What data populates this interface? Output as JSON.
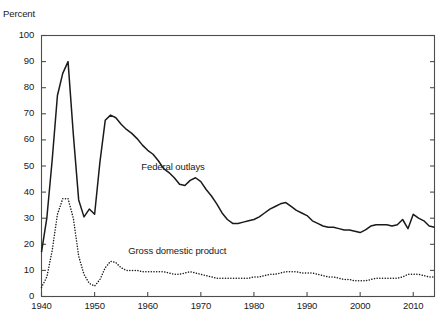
{
  "chart_data": {
    "type": "line",
    "title": "",
    "xlabel": "",
    "ylabel": "Percent",
    "ylim": [
      0,
      100
    ],
    "xlim": [
      1940,
      2014
    ],
    "yticks": [
      0,
      10,
      20,
      30,
      40,
      50,
      60,
      70,
      80,
      90,
      100
    ],
    "xticks": [
      1940,
      1950,
      1960,
      1970,
      1980,
      1990,
      2000,
      2010
    ],
    "grid": false,
    "legend_position": "inline-annotation",
    "annotations": [
      {
        "text": "Federal outlays",
        "x": 1965,
        "y": 49.5
      },
      {
        "text": "Gross domestic product",
        "x": 1965,
        "y": 17.5
      }
    ],
    "series": [
      {
        "name": "Federal outlays",
        "style": "solid",
        "color": "#1a1a1a",
        "x": [
          1940,
          1941,
          1942,
          1943,
          1944,
          1945,
          1946,
          1947,
          1948,
          1949,
          1950,
          1951,
          1952,
          1953,
          1954,
          1955,
          1956,
          1957,
          1958,
          1959,
          1960,
          1961,
          1962,
          1963,
          1964,
          1965,
          1966,
          1967,
          1968,
          1969,
          1970,
          1971,
          1972,
          1973,
          1974,
          1975,
          1976,
          1977,
          1978,
          1979,
          1980,
          1981,
          1982,
          1983,
          1984,
          1985,
          1986,
          1987,
          1988,
          1989,
          1990,
          1991,
          1992,
          1993,
          1994,
          1995,
          1996,
          1997,
          1998,
          1999,
          2000,
          2001,
          2002,
          2003,
          2004,
          2005,
          2006,
          2007,
          2008,
          2009,
          2010,
          2011,
          2012,
          2013,
          2014
        ],
        "values": [
          17.0,
          30.0,
          52.0,
          77.0,
          85.5,
          90.0,
          62.0,
          37.0,
          30.5,
          33.5,
          31.5,
          51.5,
          67.5,
          69.5,
          68.5,
          66.0,
          64.0,
          62.5,
          60.5,
          58.0,
          56.0,
          54.5,
          52.0,
          49.0,
          47.5,
          45.5,
          43.0,
          42.5,
          44.5,
          45.5,
          44.0,
          41.0,
          38.5,
          35.5,
          32.0,
          29.5,
          28.0,
          28.0,
          28.5,
          29.0,
          29.5,
          30.5,
          32.0,
          33.5,
          34.5,
          35.5,
          36.0,
          34.5,
          33.0,
          32.0,
          31.0,
          29.0,
          28.0,
          27.0,
          26.5,
          26.5,
          26.0,
          25.5,
          25.5,
          25.0,
          24.5,
          25.5,
          27.0,
          27.5,
          27.5,
          27.5,
          27.0,
          27.5,
          29.5,
          26.0,
          31.5,
          30.0,
          29.0,
          27.0,
          26.5
        ]
      },
      {
        "name": "Gross domestic product",
        "style": "dotted",
        "color": "#1a1a1a",
        "x": [
          1940,
          1941,
          1942,
          1943,
          1944,
          1945,
          1946,
          1947,
          1948,
          1949,
          1950,
          1951,
          1952,
          1953,
          1954,
          1955,
          1956,
          1957,
          1958,
          1959,
          1960,
          1961,
          1962,
          1963,
          1964,
          1965,
          1966,
          1967,
          1968,
          1969,
          1970,
          1971,
          1972,
          1973,
          1974,
          1975,
          1976,
          1977,
          1978,
          1979,
          1980,
          1981,
          1982,
          1983,
          1984,
          1985,
          1986,
          1987,
          1988,
          1989,
          1990,
          1991,
          1992,
          1993,
          1994,
          1995,
          1996,
          1997,
          1998,
          1999,
          2000,
          2001,
          2002,
          2003,
          2004,
          2005,
          2006,
          2007,
          2008,
          2009,
          2010,
          2011,
          2012,
          2013,
          2014
        ],
        "values": [
          3.5,
          7.5,
          17.5,
          31.5,
          37.5,
          37.5,
          30.0,
          15.5,
          8.5,
          5.0,
          4.0,
          6.5,
          11.0,
          13.5,
          13.0,
          11.0,
          10.0,
          10.0,
          10.0,
          9.5,
          9.5,
          9.5,
          9.5,
          9.5,
          9.0,
          8.5,
          8.5,
          9.0,
          9.5,
          9.0,
          8.5,
          8.0,
          7.5,
          7.0,
          7.0,
          7.0,
          7.0,
          7.0,
          7.0,
          7.0,
          7.5,
          7.5,
          8.0,
          8.5,
          8.5,
          9.0,
          9.5,
          9.5,
          9.5,
          9.0,
          9.0,
          9.0,
          8.5,
          8.0,
          7.5,
          7.5,
          7.0,
          6.5,
          6.5,
          6.0,
          6.0,
          6.0,
          6.5,
          7.0,
          7.0,
          7.0,
          7.0,
          7.0,
          7.5,
          8.5,
          8.5,
          8.5,
          8.0,
          7.5,
          7.5
        ]
      }
    ]
  },
  "axes": {
    "y_title": "Percent",
    "y_tick_labels": [
      "100",
      "90",
      "80",
      "70",
      "60",
      "50",
      "40",
      "30",
      "20",
      "10",
      "0"
    ],
    "x_tick_labels": [
      "1940",
      "1950",
      "1960",
      "1970",
      "1980",
      "1990",
      "2000",
      "2010"
    ]
  },
  "labels": {
    "federal_outlays": "Federal outlays",
    "gross_domestic_product": "Gross domestic product"
  },
  "colors": {
    "line": "#1a1a1a",
    "axis": "#4d4d4d",
    "background": "#ffffff"
  }
}
